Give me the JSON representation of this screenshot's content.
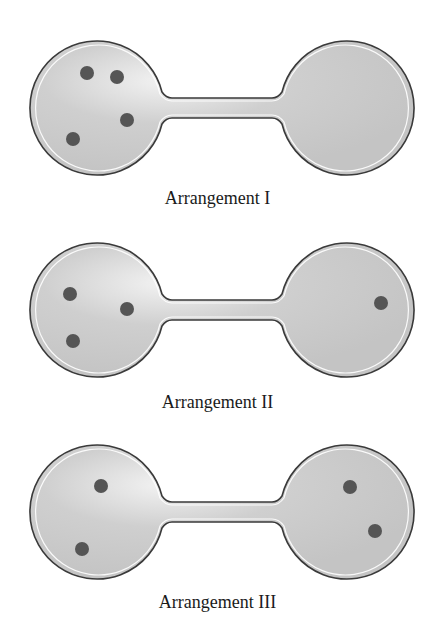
{
  "figure": {
    "colors": {
      "bulb_fill": "#cfcfcf",
      "bulb_highlight": "#f2f2f2",
      "outline": "#3a3a3a",
      "molecule": "#555555",
      "background": "#ffffff"
    },
    "arrangements": [
      {
        "label": "Arrangement I",
        "left_count": 4,
        "right_count": 0,
        "left_molecules": [
          [
            87,
            73
          ],
          [
            117,
            77
          ],
          [
            127,
            120
          ],
          [
            73,
            139
          ]
        ],
        "right_molecules": []
      },
      {
        "label": "Arrangement II",
        "left_count": 3,
        "right_count": 1,
        "left_molecules": [
          [
            70,
            74
          ],
          [
            127,
            89
          ],
          [
            73,
            121
          ]
        ],
        "right_molecules": [
          [
            381,
            83
          ]
        ]
      },
      {
        "label": "Arrangement III",
        "left_count": 2,
        "right_count": 2,
        "left_molecules": [
          [
            101,
            66
          ],
          [
            82,
            129
          ]
        ],
        "right_molecules": [
          [
            350,
            67
          ],
          [
            375,
            111
          ]
        ]
      }
    ]
  }
}
